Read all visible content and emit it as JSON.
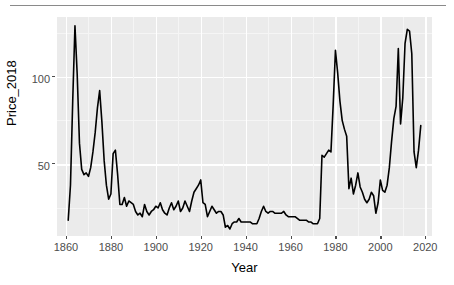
{
  "chart_data": {
    "type": "line",
    "title": "",
    "xlabel": "Year",
    "ylabel": "Price_2018",
    "xlim": [
      1856,
      2023
    ],
    "ylim": [
      9,
      134
    ],
    "grid": true,
    "legend": null,
    "x_ticks": [
      1860,
      1880,
      1900,
      1920,
      1940,
      1960,
      1980,
      2000,
      2020
    ],
    "y_ticks": [
      50,
      100
    ],
    "line_color": "#000000",
    "panel_color": "#ebebeb",
    "gridline_color": "#ffffff",
    "series": [
      {
        "name": "Price_2018",
        "x": [
          1861,
          1862,
          1863,
          1864,
          1865,
          1866,
          1867,
          1868,
          1869,
          1870,
          1871,
          1872,
          1873,
          1874,
          1875,
          1876,
          1877,
          1878,
          1879,
          1880,
          1881,
          1882,
          1883,
          1884,
          1885,
          1886,
          1887,
          1888,
          1889,
          1890,
          1891,
          1892,
          1893,
          1894,
          1895,
          1896,
          1897,
          1898,
          1899,
          1900,
          1901,
          1902,
          1903,
          1904,
          1905,
          1906,
          1907,
          1908,
          1909,
          1910,
          1911,
          1912,
          1913,
          1914,
          1915,
          1916,
          1917,
          1918,
          1919,
          1920,
          1921,
          1922,
          1923,
          1924,
          1925,
          1926,
          1927,
          1928,
          1929,
          1930,
          1931,
          1932,
          1933,
          1934,
          1935,
          1936,
          1937,
          1938,
          1939,
          1940,
          1941,
          1942,
          1943,
          1944,
          1945,
          1946,
          1947,
          1948,
          1949,
          1950,
          1951,
          1952,
          1953,
          1954,
          1955,
          1956,
          1957,
          1958,
          1959,
          1960,
          1961,
          1962,
          1963,
          1964,
          1965,
          1966,
          1967,
          1968,
          1969,
          1970,
          1971,
          1972,
          1973,
          1974,
          1975,
          1976,
          1977,
          1978,
          1979,
          1980,
          1981,
          1982,
          1983,
          1984,
          1985,
          1986,
          1987,
          1988,
          1989,
          1990,
          1991,
          1992,
          1993,
          1994,
          1995,
          1996,
          1997,
          1998,
          1999,
          2000,
          2001,
          2002,
          2003,
          2004,
          2005,
          2006,
          2007,
          2008,
          2009,
          2010,
          2011,
          2012,
          2013,
          2014,
          2015,
          2016,
          2017,
          2018
        ],
        "values": [
          18,
          38,
          86,
          129,
          101,
          62,
          47,
          44,
          45,
          43,
          48,
          57,
          68,
          82,
          92,
          74,
          52,
          38,
          30,
          33,
          56,
          58,
          44,
          27,
          27,
          31,
          26,
          29,
          28,
          27,
          23,
          21,
          22,
          20,
          27,
          23,
          21,
          23,
          24,
          26,
          25,
          28,
          24,
          22,
          21,
          25,
          28,
          24,
          26,
          29,
          23,
          25,
          29,
          26,
          23,
          29,
          34,
          36,
          38,
          41,
          28,
          27,
          20,
          23,
          26,
          24,
          22,
          23,
          23,
          21,
          14,
          15,
          13,
          16,
          17,
          17,
          19,
          17,
          17,
          17,
          17,
          17,
          16,
          16,
          16,
          19,
          23,
          26,
          23,
          22,
          23,
          23,
          22,
          22,
          22,
          22,
          23,
          21,
          20,
          20,
          20,
          20,
          19,
          18,
          18,
          18,
          18,
          17,
          17,
          16,
          16,
          16,
          19,
          55,
          54,
          56,
          58,
          57,
          84,
          115,
          102,
          86,
          75,
          70,
          66,
          36,
          42,
          33,
          38,
          45,
          37,
          34,
          30,
          28,
          30,
          34,
          32,
          22,
          28,
          41,
          35,
          34,
          38,
          48,
          63,
          76,
          83,
          116,
          73,
          88,
          119,
          127,
          126,
          113,
          57,
          48,
          58,
          72
        ]
      }
    ]
  },
  "axis": {
    "y_title": "Price_2018",
    "x_title": "Year",
    "y_tick_labels": [
      "50",
      "100"
    ],
    "x_tick_labels": [
      "1860",
      "1880",
      "1900",
      "1920",
      "1940",
      "1960",
      "1980",
      "2000",
      "2020"
    ]
  }
}
